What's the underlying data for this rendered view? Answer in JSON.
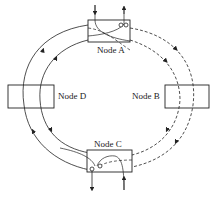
{
  "diagram": {
    "type": "dual-ring network",
    "nodes": [
      {
        "id": "A",
        "label": "Node A",
        "position": "top"
      },
      {
        "id": "B",
        "label": "Node B",
        "position": "right"
      },
      {
        "id": "C",
        "label": "Node C",
        "position": "bottom"
      },
      {
        "id": "D",
        "label": "Node D",
        "position": "left"
      }
    ],
    "rings": [
      {
        "name": "outer-ring",
        "style": "solid (left) / dashed (right)"
      },
      {
        "name": "inner-ring",
        "style": "solid (left) / dashed (right)"
      }
    ],
    "colors": {
      "stroke": "#222222",
      "background": "#ffffff"
    }
  }
}
